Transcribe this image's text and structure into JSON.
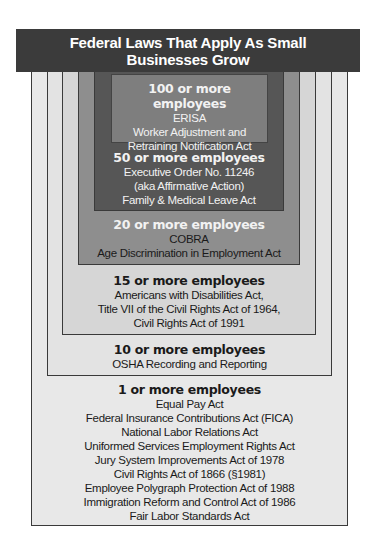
{
  "title": "Federal Laws That Apply As Small Businesses Grow",
  "tiers": [
    {
      "threshold": "1 or more employees",
      "laws": [
        "Equal Pay Act",
        "Federal Insurance Contributions Act (FICA)",
        "National Labor Relations Act",
        "Uniformed Services Employment Rights Act",
        "Jury System Improvements Act of 1978",
        "Civil Rights Act of 1866 (§1981)",
        "Employee Polygraph Protection Act of 1988",
        "Immigration Reform and Control Act of 1986",
        "Fair Labor Standards Act"
      ]
    },
    {
      "threshold": "10 or more employees",
      "laws": [
        "OSHA Recording and Reporting"
      ]
    },
    {
      "threshold": "15 or more employees",
      "laws": [
        "Americans with Disabilities Act,",
        "Title VII of the Civil Rights Act of 1964,",
        "Civil Rights Act of 1991"
      ]
    },
    {
      "threshold": "20 or more employees",
      "laws": [
        "COBRA",
        "Age Discrimination in Employment Act"
      ]
    },
    {
      "threshold": "50 or more employees",
      "laws": [
        "Executive Order No. 11246",
        "(aka Affirmative Action)",
        "Family & Medical Leave Act"
      ]
    },
    {
      "threshold": "100 or more employees",
      "laws": [
        "ERISA",
        "Worker Adjustment and",
        "Retraining Notification Act"
      ]
    }
  ],
  "colors": {
    "header": "#3b3b3b",
    "tier_1": "#e8e8e8",
    "tier_10": "#e3e3e3",
    "tier_15": "#d6d6d6",
    "tier_20": "#8e8e8e",
    "tier_50": "#565656",
    "tier_100": "#7e7e7e"
  }
}
